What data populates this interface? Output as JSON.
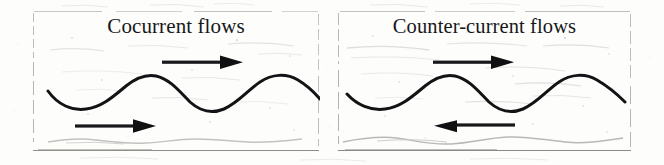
{
  "figure": {
    "background_color": "#fdfdfc",
    "ink_color": "#111114",
    "faint_ink_color": "#b4b4b0",
    "border_color": "#b9b9b4",
    "width": 664,
    "height": 165
  },
  "panels": [
    {
      "id": "cocurrent",
      "title": "Cocurrent flows",
      "arrows": [
        {
          "name": "upper-flow-arrow",
          "direction": "right",
          "label": ""
        },
        {
          "name": "lower-flow-arrow",
          "direction": "right",
          "label": ""
        }
      ],
      "wave": {
        "name": "interface-wave",
        "periods": 2,
        "amplitude_px": 13,
        "centerline_y_px": 85,
        "style": "solid-bold"
      },
      "faint_wave": {
        "name": "lower-faint-wave",
        "periods": 2,
        "amplitude_px": 4,
        "centerline_y_px": 139,
        "style": "faint-gray"
      }
    },
    {
      "id": "counter-current",
      "title": "Counter-current flows",
      "arrows": [
        {
          "name": "upper-flow-arrow",
          "direction": "right",
          "label": ""
        },
        {
          "name": "lower-flow-arrow",
          "direction": "left",
          "label": ""
        }
      ],
      "wave": {
        "name": "interface-wave",
        "periods": 2,
        "amplitude_px": 13,
        "centerline_y_px": 85,
        "style": "solid-bold"
      },
      "faint_wave": {
        "name": "lower-faint-wave",
        "periods": 2,
        "amplitude_px": 4,
        "centerline_y_px": 139,
        "style": "faint-gray"
      }
    }
  ]
}
